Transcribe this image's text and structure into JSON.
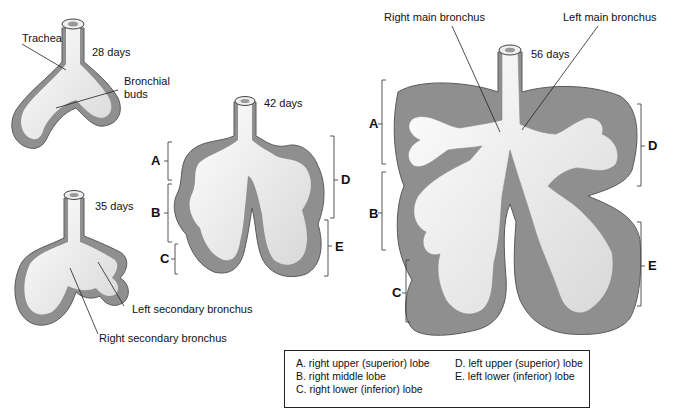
{
  "stages": [
    {
      "id": "28",
      "label": "28 days",
      "annotations": [
        "Trachea",
        "Bronchial buds"
      ]
    },
    {
      "id": "35",
      "label": "35 days",
      "annotations": [
        "Left secondary bronchus",
        "Right secondary bronchus"
      ]
    },
    {
      "id": "42",
      "label": "42 days",
      "brackets": [
        "A",
        "B",
        "C",
        "D",
        "E"
      ]
    },
    {
      "id": "56",
      "label": "56 days",
      "annotations": [
        "Right main bronchus",
        "Left main bronchus"
      ],
      "brackets": [
        "A",
        "B",
        "C",
        "D",
        "E"
      ]
    }
  ],
  "labels": {
    "trachea": "Trachea",
    "bronchial_buds_1": "Bronchial",
    "bronchial_buds_2": "buds",
    "d28": "28 days",
    "d35": "35 days",
    "d42": "42 days",
    "d56": "56 days",
    "left_secondary": "Left secondary bronchus",
    "right_secondary": "Right secondary bronchus",
    "right_main": "Right main bronchus",
    "left_main": "Left main bronchus"
  },
  "letters": {
    "a": "A",
    "b": "B",
    "c": "C",
    "d": "D",
    "e": "E"
  },
  "legend": {
    "a": "A.  right upper (superior) lobe",
    "b": "B.  right middle lobe",
    "c": "C.  right lower (inferior) lobe",
    "d": "D.  left upper (superior) lobe",
    "e": "E.  left lower (inferior) lobe"
  },
  "colors": {
    "tissue": "#8f8f8f",
    "tissue_edge": "#5a5a5a",
    "airway": "#f2f2f2",
    "line": "#222222"
  }
}
